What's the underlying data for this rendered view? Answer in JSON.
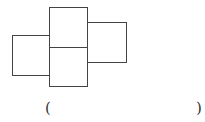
{
  "figure": {
    "stroke_color": "#444444",
    "squares": [
      {
        "name": "left",
        "x": 12,
        "y": 35,
        "w": 37,
        "h": 40
      },
      {
        "name": "middle-top",
        "x": 49,
        "y": 7,
        "w": 38,
        "h": 40
      },
      {
        "name": "middle-bottom",
        "x": 49,
        "y": 47,
        "w": 38,
        "h": 39
      },
      {
        "name": "right",
        "x": 87,
        "y": 22,
        "w": 39,
        "h": 40
      }
    ]
  },
  "answer_blank": {
    "open": "(",
    "close": ")"
  }
}
